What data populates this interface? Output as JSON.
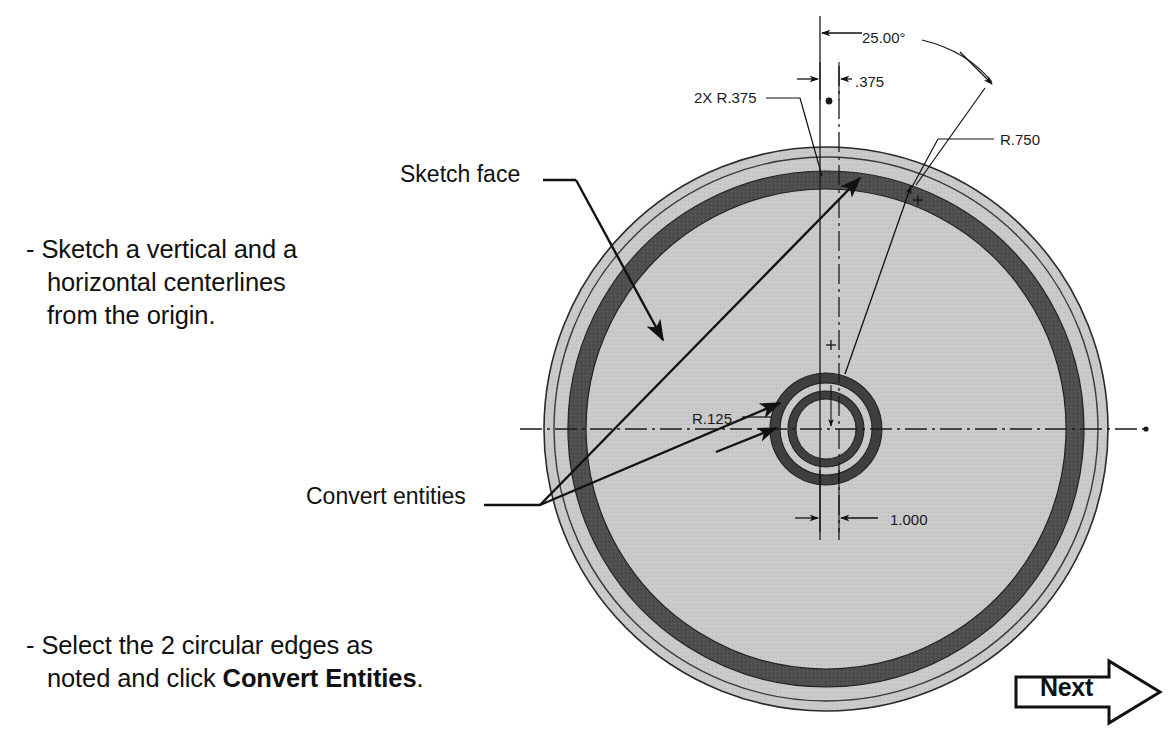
{
  "page": {
    "background_color": "#ffffff",
    "title_text_color": "#111111"
  },
  "instructions": [
    {
      "id": "sketch-centerlines",
      "line1": "- Sketch a vertical and a",
      "line2": "   horizontal centerlines",
      "line3": "   from the origin."
    },
    {
      "id": "convert-entities",
      "line1": "- Select the 2 circular edges as",
      "line2_prefix": "   noted and click ",
      "line2_bold": "Convert Entities",
      "line2_suffix": "."
    }
  ],
  "callouts": [
    {
      "id": "sketch-face",
      "label": "Sketch face"
    },
    {
      "id": "convert-entities",
      "label": "Convert entities"
    }
  ],
  "dimensions": [
    {
      "id": "angle",
      "label": "25.00°"
    },
    {
      "id": "offset",
      "label": ".375"
    },
    {
      "id": "fillet",
      "label": "2X R.375"
    },
    {
      "id": "r750",
      "label": "R.750"
    },
    {
      "id": "r125",
      "label": "R.125"
    },
    {
      "id": "width",
      "label": "1.000"
    }
  ],
  "next_button": {
    "label": "Next",
    "shape": "right-arrow-outline"
  },
  "drawing": {
    "type": "technical-drawing",
    "description": "SolidWorks part front view: large disc with inner annular groove and concentric bore rings",
    "center": {
      "x": 826,
      "y": 429
    },
    "outer_disc_radius": 282,
    "outer_rim_inner_radius": 272,
    "groove_outer_radius": 258,
    "groove_inner_radius": 240,
    "bore_outer_radius": 56,
    "bore_mid_radius": 46,
    "bore_inner_radius": 38,
    "face_fill_color": "#c9c9c9",
    "groove_fill_color": "#4f4f4f",
    "line_color": "#1a1a1a",
    "centerline_color": "#1a1a1a"
  }
}
